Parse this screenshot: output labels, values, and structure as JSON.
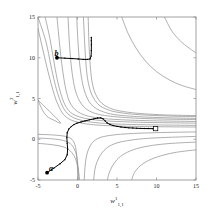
{
  "figure": {
    "kind": "contour-plot-with-trajectories",
    "background_color": "#ffffff",
    "axis_color": "#808080",
    "contour_color": "#8c8c8c",
    "trajectory_color": "#000000"
  },
  "axes": {
    "x": {
      "title_base": "w",
      "title_sup": "1",
      "title_sub": "1,1",
      "min": -5,
      "max": 15,
      "ticks": [
        -5,
        0,
        5,
        10,
        15
      ],
      "tick_labels": [
        "-5",
        "0",
        "5",
        "10",
        "15"
      ]
    },
    "y": {
      "title_base": "w",
      "title_sup": "2",
      "title_sub": "1,1",
      "min": -5,
      "max": 15,
      "ticks": [
        -5,
        0,
        5,
        10,
        15
      ],
      "tick_labels": [
        "-5",
        "0",
        "5",
        "10",
        "15"
      ]
    }
  },
  "annotations": [
    {
      "name": "label-a",
      "text": "a",
      "x": -3.6,
      "y": -3.1
    },
    {
      "name": "label-b",
      "text": "b",
      "x": -2.9,
      "y": 10.9
    }
  ],
  "chart_data": {
    "type": "line",
    "title": "",
    "xlabel": "w^1_{1,1}",
    "ylabel": "w^2_{1,1}",
    "xlim": [
      -5,
      15
    ],
    "ylim": [
      -5,
      15
    ],
    "grid": false,
    "legend": "none",
    "contour_note": "Saddle-shaped error surface contours, hyperbola-like level sets asymptotic to the vertical line near x=1.7 and the horizontal line near y=1.3",
    "contours": [
      {
        "name": "c1",
        "level": 1,
        "points": [
          [
            -5,
            13.6
          ],
          [
            -4.2,
            10.2
          ],
          [
            -3.6,
            7.8
          ],
          [
            -3.1,
            6.0
          ],
          [
            -2.7,
            4.8
          ],
          [
            -2.3,
            3.9
          ],
          [
            -1.9,
            3.2
          ],
          [
            -1.4,
            2.7
          ],
          [
            -0.8,
            2.35
          ],
          [
            0.0,
            2.1
          ],
          [
            1.0,
            1.9
          ],
          [
            2.4,
            1.75
          ],
          [
            4.0,
            1.66
          ],
          [
            6.0,
            1.6
          ],
          [
            8.5,
            1.56
          ],
          [
            11.0,
            1.53
          ],
          [
            15,
            1.5
          ]
        ]
      },
      {
        "name": "c2",
        "level": 2,
        "points": [
          [
            -5,
            15
          ],
          [
            -4.0,
            12.0
          ],
          [
            -3.4,
            9.2
          ],
          [
            -2.9,
            7.0
          ],
          [
            -2.5,
            5.6
          ],
          [
            -2.1,
            4.5
          ],
          [
            -1.7,
            3.7
          ],
          [
            -1.2,
            3.1
          ],
          [
            -0.5,
            2.65
          ],
          [
            0.4,
            2.35
          ],
          [
            1.6,
            2.12
          ],
          [
            3.0,
            1.98
          ],
          [
            5.0,
            1.87
          ],
          [
            7.5,
            1.8
          ],
          [
            10.5,
            1.75
          ],
          [
            15,
            1.7
          ]
        ]
      },
      {
        "name": "c3",
        "level": 3,
        "points": [
          [
            -4.1,
            15
          ],
          [
            -3.5,
            12.4
          ],
          [
            -3.0,
            9.6
          ],
          [
            -2.6,
            7.5
          ],
          [
            -2.2,
            5.9
          ],
          [
            -1.8,
            4.7
          ],
          [
            -1.4,
            3.9
          ],
          [
            -0.9,
            3.3
          ],
          [
            -0.2,
            2.9
          ],
          [
            0.8,
            2.6
          ],
          [
            2.0,
            2.4
          ],
          [
            3.6,
            2.25
          ],
          [
            5.8,
            2.15
          ],
          [
            8.4,
            2.07
          ],
          [
            11.6,
            2.02
          ],
          [
            15,
            1.98
          ]
        ]
      },
      {
        "name": "c4",
        "level": 4,
        "points": [
          [
            -2.6,
            15
          ],
          [
            -2.3,
            12.0
          ],
          [
            -2.0,
            9.3
          ],
          [
            -1.7,
            7.3
          ],
          [
            -1.4,
            5.8
          ],
          [
            -1.05,
            4.7
          ],
          [
            -0.6,
            3.95
          ],
          [
            0.0,
            3.4
          ],
          [
            0.8,
            3.0
          ],
          [
            1.8,
            2.75
          ],
          [
            3.2,
            2.55
          ],
          [
            5.0,
            2.42
          ],
          [
            7.4,
            2.32
          ],
          [
            10.4,
            2.25
          ],
          [
            15,
            2.18
          ]
        ]
      },
      {
        "name": "c5",
        "level": 5,
        "points": [
          [
            -1.2,
            15
          ],
          [
            -1.05,
            12.2
          ],
          [
            -0.85,
            9.6
          ],
          [
            -0.6,
            7.6
          ],
          [
            -0.3,
            6.1
          ],
          [
            0.1,
            5.0
          ],
          [
            0.6,
            4.2
          ],
          [
            1.2,
            3.65
          ],
          [
            2.0,
            3.25
          ],
          [
            3.1,
            2.97
          ],
          [
            4.6,
            2.78
          ],
          [
            6.6,
            2.63
          ],
          [
            9.2,
            2.52
          ],
          [
            12.2,
            2.45
          ],
          [
            15,
            2.42
          ]
        ]
      },
      {
        "name": "c6",
        "level": 6,
        "points": [
          [
            -0.1,
            15
          ],
          [
            0.05,
            12.1
          ],
          [
            0.25,
            9.5
          ],
          [
            0.5,
            7.6
          ],
          [
            0.8,
            6.2
          ],
          [
            1.2,
            5.1
          ],
          [
            1.7,
            4.3
          ],
          [
            2.4,
            3.75
          ],
          [
            3.3,
            3.35
          ],
          [
            4.5,
            3.05
          ],
          [
            6.1,
            2.88
          ],
          [
            8.2,
            2.74
          ],
          [
            11.0,
            2.64
          ],
          [
            15,
            2.56
          ]
        ]
      },
      {
        "name": "c7",
        "level": 7,
        "points": [
          [
            0.75,
            15
          ],
          [
            0.9,
            12.0
          ],
          [
            1.05,
            9.5
          ],
          [
            1.25,
            7.6
          ],
          [
            1.55,
            6.2
          ],
          [
            1.95,
            5.2
          ],
          [
            2.5,
            4.4
          ],
          [
            3.2,
            3.9
          ],
          [
            4.2,
            3.5
          ],
          [
            5.5,
            3.25
          ],
          [
            7.3,
            3.05
          ],
          [
            9.6,
            2.92
          ],
          [
            12.6,
            2.82
          ],
          [
            15,
            2.78
          ]
        ]
      },
      {
        "name": "c8",
        "level": 8,
        "points": [
          [
            1.35,
            15
          ],
          [
            1.45,
            11.8
          ],
          [
            1.6,
            9.2
          ],
          [
            1.8,
            7.3
          ],
          [
            2.1,
            6.0
          ],
          [
            2.55,
            5.05
          ],
          [
            3.1,
            4.4
          ],
          [
            3.9,
            3.9
          ],
          [
            5.0,
            3.55
          ],
          [
            6.5,
            3.3
          ],
          [
            8.5,
            3.12
          ],
          [
            11.2,
            2.98
          ],
          [
            15,
            2.9
          ]
        ]
      },
      {
        "name": "c9-low",
        "level": -1,
        "points": [
          [
            -5,
            0.6
          ],
          [
            -3.5,
            0.55
          ],
          [
            -2.2,
            0.45
          ],
          [
            -1.3,
            0.3
          ],
          [
            -0.7,
            0.0
          ],
          [
            -0.35,
            -0.6
          ],
          [
            -0.15,
            -1.5
          ],
          [
            -0.05,
            -2.6
          ],
          [
            0.0,
            -3.8
          ],
          [
            0.02,
            -5
          ]
        ]
      },
      {
        "name": "c10-low",
        "level": -2,
        "points": [
          [
            -5,
            0.15
          ],
          [
            -3.2,
            0.05
          ],
          [
            -1.8,
            -0.15
          ],
          [
            -0.9,
            -0.55
          ],
          [
            -0.4,
            -1.2
          ],
          [
            -0.1,
            -2.1
          ],
          [
            0.05,
            -3.2
          ],
          [
            0.12,
            -4.3
          ],
          [
            0.15,
            -5
          ]
        ]
      },
      {
        "name": "c11-low",
        "level": -3,
        "points": [
          [
            -5,
            -0.5
          ],
          [
            -3.0,
            -0.7
          ],
          [
            -1.6,
            -1.0
          ],
          [
            -0.75,
            -1.6
          ],
          [
            -0.25,
            -2.4
          ],
          [
            0.05,
            -3.4
          ],
          [
            0.2,
            -4.4
          ],
          [
            0.25,
            -5
          ]
        ]
      },
      {
        "name": "c12-right",
        "level": 0,
        "points": [
          [
            15,
            0.9
          ],
          [
            12.0,
            0.85
          ],
          [
            9.0,
            0.78
          ],
          [
            6.5,
            0.68
          ],
          [
            4.5,
            0.52
          ],
          [
            3.0,
            0.25
          ],
          [
            2.1,
            -0.2
          ],
          [
            1.55,
            -0.9
          ],
          [
            1.2,
            -1.8
          ],
          [
            1.0,
            -2.9
          ],
          [
            0.9,
            -4.1
          ],
          [
            0.85,
            -5
          ]
        ]
      },
      {
        "name": "c13-right",
        "level": -1,
        "points": [
          [
            15,
            0.35
          ],
          [
            12.0,
            0.25
          ],
          [
            9.0,
            0.12
          ],
          [
            6.8,
            -0.1
          ],
          [
            5.0,
            -0.45
          ],
          [
            3.8,
            -1.0
          ],
          [
            3.0,
            -1.8
          ],
          [
            2.5,
            -2.7
          ],
          [
            2.2,
            -3.7
          ],
          [
            2.05,
            -5
          ]
        ]
      },
      {
        "name": "c14-right",
        "level": -2,
        "points": [
          [
            15,
            -0.35
          ],
          [
            12.0,
            -0.5
          ],
          [
            9.5,
            -0.75
          ],
          [
            7.5,
            -1.15
          ],
          [
            6.0,
            -1.75
          ],
          [
            5.0,
            -2.5
          ],
          [
            4.35,
            -3.4
          ],
          [
            3.95,
            -4.3
          ],
          [
            3.8,
            -5
          ]
        ]
      },
      {
        "name": "c15-right",
        "level": -3,
        "points": [
          [
            15,
            -1.3
          ],
          [
            12.5,
            -1.6
          ],
          [
            10.5,
            -2.05
          ],
          [
            9.0,
            -2.6
          ],
          [
            7.9,
            -3.3
          ],
          [
            7.2,
            -4.1
          ],
          [
            6.85,
            -5
          ]
        ]
      },
      {
        "name": "c16-topright",
        "level": 9,
        "points": [
          [
            5.6,
            15
          ],
          [
            6.4,
            13.0
          ],
          [
            7.4,
            11.2
          ],
          [
            8.6,
            9.6
          ],
          [
            10.0,
            8.3
          ],
          [
            11.6,
            7.3
          ],
          [
            13.2,
            6.6
          ],
          [
            15,
            6.1
          ]
        ]
      },
      {
        "name": "c17-topright",
        "level": 10,
        "points": [
          [
            11.0,
            15
          ],
          [
            12.0,
            13.2
          ],
          [
            13.2,
            11.9
          ],
          [
            14.4,
            11.0
          ],
          [
            15,
            10.6
          ]
        ]
      },
      {
        "name": "c18-farleft",
        "level": 0,
        "points": [
          [
            -5,
            4.8
          ],
          [
            -4.6,
            3.9
          ],
          [
            -4.2,
            3.2
          ],
          [
            -3.7,
            2.7
          ],
          [
            -3.0,
            2.35
          ],
          [
            -2.2,
            2.1
          ],
          [
            -5,
            4.8
          ]
        ]
      }
    ],
    "trajectories": [
      {
        "name": "trajectory-a",
        "label": "a",
        "start_marker": "filled-circle",
        "end_marker": "open-square",
        "start": [
          -3.85,
          -4.1
        ],
        "end": [
          9.9,
          1.3
        ],
        "points": [
          [
            -3.85,
            -4.1
          ],
          [
            -3.0,
            -3.55
          ],
          [
            -2.2,
            -3.0
          ],
          [
            -1.6,
            -2.5
          ],
          [
            -1.3,
            -1.9
          ],
          [
            -1.25,
            -1.2
          ],
          [
            -1.3,
            -0.5
          ],
          [
            -1.35,
            0.2
          ],
          [
            -1.3,
            0.8
          ],
          [
            -1.1,
            1.25
          ],
          [
            -0.8,
            1.55
          ],
          [
            -0.45,
            1.8
          ],
          [
            -0.05,
            1.98
          ],
          [
            0.45,
            2.12
          ],
          [
            0.95,
            2.25
          ],
          [
            1.5,
            2.38
          ],
          [
            2.05,
            2.5
          ],
          [
            2.55,
            2.6
          ],
          [
            2.95,
            2.62
          ],
          [
            3.25,
            2.5
          ],
          [
            3.5,
            2.25
          ],
          [
            3.75,
            2.0
          ],
          [
            4.1,
            1.82
          ],
          [
            4.5,
            1.68
          ],
          [
            5.0,
            1.58
          ],
          [
            5.5,
            1.5
          ],
          [
            6.0,
            1.45
          ],
          [
            6.5,
            1.4
          ],
          [
            7.0,
            1.38
          ],
          [
            7.5,
            1.35
          ],
          [
            8.0,
            1.33
          ],
          [
            8.5,
            1.32
          ],
          [
            9.0,
            1.31
          ],
          [
            9.5,
            1.3
          ],
          [
            9.9,
            1.3
          ]
        ]
      },
      {
        "name": "trajectory-b",
        "label": "b",
        "start_marker": "filled-circle",
        "end_marker": "none",
        "start": [
          -2.6,
          10.0
        ],
        "end": [
          1.75,
          12.5
        ],
        "points": [
          [
            -2.6,
            10.0
          ],
          [
            -1.6,
            9.95
          ],
          [
            -0.7,
            9.9
          ],
          [
            0.1,
            9.85
          ],
          [
            0.75,
            9.8
          ],
          [
            1.25,
            9.8
          ],
          [
            1.6,
            9.85
          ],
          [
            1.72,
            10.2
          ],
          [
            1.75,
            10.9
          ],
          [
            1.76,
            11.6
          ],
          [
            1.75,
            12.1
          ],
          [
            1.75,
            12.5
          ]
        ]
      }
    ]
  }
}
